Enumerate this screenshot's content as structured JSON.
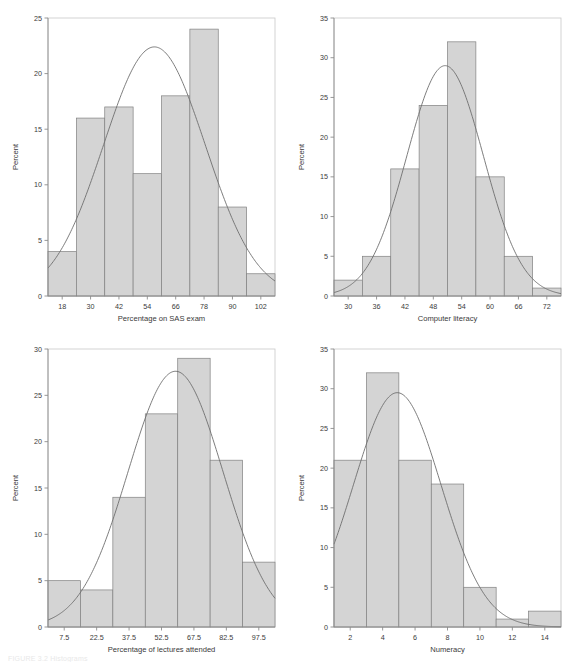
{
  "figure": {
    "caption_partial": "FIGURE 3.2 Histograms",
    "bar_fill": "#d4d4d4",
    "bar_stroke": "#808080",
    "curve_color": "#6e6e6e",
    "axis_color": "#8c8c8c",
    "text_color": "#3a3a3a"
  },
  "chart_data": [
    {
      "type": "bar",
      "title": "",
      "xlabel": "Percentage on SAS exam",
      "ylabel": "Percent",
      "ylim": [
        0,
        25
      ],
      "yticks": [
        0,
        5,
        10,
        15,
        20,
        25
      ],
      "xticks": [
        18,
        30,
        42,
        54,
        66,
        78,
        90,
        102
      ],
      "xlim": [
        12,
        108
      ],
      "bin_width": 12,
      "bin_starts": [
        12,
        24,
        36,
        48,
        60,
        72,
        84,
        96
      ],
      "categories": [
        "18",
        "30",
        "42",
        "54",
        "66",
        "78",
        "90",
        "102"
      ],
      "values": [
        4,
        16,
        17,
        11,
        18,
        24,
        8,
        2
      ],
      "grid": false,
      "overlay": "normal-curve",
      "overlay_peak_y": 22.4,
      "overlay_peak_x": 57,
      "legend": "none"
    },
    {
      "type": "bar",
      "title": "",
      "xlabel": "Computer literacy",
      "ylabel": "Percent",
      "ylim": [
        0,
        35
      ],
      "yticks": [
        0,
        5,
        10,
        15,
        20,
        25,
        30,
        35
      ],
      "xticks": [
        30,
        36,
        42,
        48,
        54,
        60,
        66,
        72
      ],
      "xlim": [
        27,
        75
      ],
      "bin_width": 6,
      "bin_starts": [
        27,
        33,
        39,
        45,
        51,
        57,
        63,
        69
      ],
      "categories": [
        "30",
        "36",
        "42",
        "48",
        "54",
        "60",
        "66",
        "72"
      ],
      "values": [
        2,
        5,
        16,
        24,
        32,
        15,
        5,
        1
      ],
      "grid": false,
      "overlay": "normal-curve",
      "overlay_peak_y": 29.0,
      "overlay_peak_x": 50.5,
      "legend": "none"
    },
    {
      "type": "bar",
      "title": "",
      "xlabel": "Percentage of lectures attended",
      "ylabel": "Percent",
      "ylim": [
        0,
        30
      ],
      "yticks": [
        0,
        5,
        10,
        15,
        20,
        25,
        30
      ],
      "xticks": [
        7.5,
        22.5,
        37.5,
        52.5,
        67.5,
        82.5,
        97.5
      ],
      "xlim": [
        0,
        105
      ],
      "bin_width": 15,
      "bin_starts": [
        0,
        15,
        30,
        45,
        60,
        75,
        90
      ],
      "categories": [
        "7.5",
        "22.5",
        "37.5",
        "52.5",
        "67.5",
        "82.5",
        "97.5"
      ],
      "values": [
        5,
        4,
        14,
        23,
        29,
        18,
        7
      ],
      "grid": false,
      "overlay": "normal-curve",
      "overlay_peak_y": 27.6,
      "overlay_peak_x": 59,
      "legend": "none"
    },
    {
      "type": "bar",
      "title": "",
      "xlabel": "Numeracy",
      "ylabel": "Percent",
      "ylim": [
        0,
        35
      ],
      "yticks": [
        0,
        5,
        10,
        15,
        20,
        25,
        30,
        35
      ],
      "xticks": [
        2,
        4,
        6,
        8,
        10,
        12,
        14
      ],
      "xlim": [
        1,
        15
      ],
      "bin_width": 2,
      "bin_starts": [
        1,
        3,
        5,
        7,
        9,
        11,
        13
      ],
      "categories": [
        "2",
        "4",
        "6",
        "8",
        "10",
        "12",
        "14"
      ],
      "values": [
        21,
        32,
        21,
        18,
        5,
        1,
        2
      ],
      "grid": false,
      "overlay": "normal-curve",
      "overlay_peak_y": 29.5,
      "overlay_peak_x": 4.9,
      "legend": "none"
    }
  ]
}
